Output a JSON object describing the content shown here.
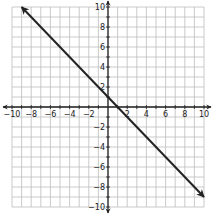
{
  "chart_data": {
    "type": "line",
    "title": "",
    "xlabel": "",
    "ylabel": "",
    "xlim": [
      -10,
      10
    ],
    "ylim": [
      -10,
      10
    ],
    "grid": true,
    "grid_step": 1,
    "x_tick_labels": [
      "-10",
      "-8",
      "-6",
      "-4",
      "-2",
      "2",
      "4",
      "6",
      "8",
      "10"
    ],
    "y_tick_labels": [
      "10",
      "8",
      "6",
      "4",
      "2",
      "-2",
      "-4",
      "-6",
      "-8",
      "-10"
    ],
    "series": [
      {
        "name": "line",
        "equation": "y = -x + 1",
        "x": [
          -9,
          10
        ],
        "y": [
          10,
          -9
        ],
        "arrows": "both",
        "color": "#222222"
      }
    ]
  },
  "colors": {
    "grid": "#bdbdbd",
    "axis": "#222222",
    "line": "#222222",
    "background": "#ffffff"
  }
}
